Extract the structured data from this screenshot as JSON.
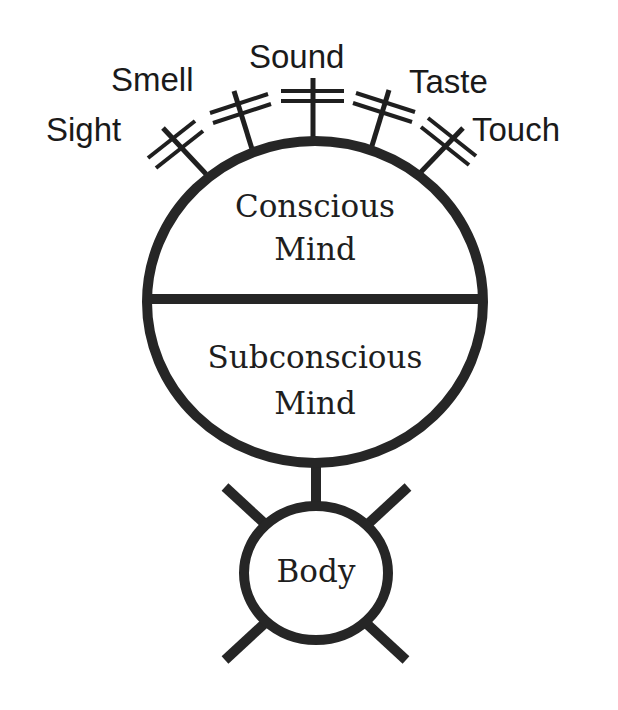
{
  "diagram": {
    "senses": [
      {
        "label": "Sight"
      },
      {
        "label": "Smell"
      },
      {
        "label": "Sound"
      },
      {
        "label": "Taste"
      },
      {
        "label": "Touch"
      }
    ],
    "mind": {
      "upper": {
        "line1": "Conscious",
        "line2": "Mind"
      },
      "lower": {
        "line1": "Subconscious",
        "line2": "Mind"
      }
    },
    "body": {
      "label": "Body"
    },
    "colors": {
      "stroke": "#262626",
      "background": "#ffffff",
      "text": "#1a1a1a"
    }
  }
}
